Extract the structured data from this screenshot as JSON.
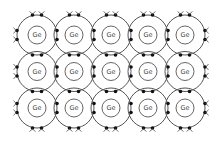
{
  "diagram": {
    "title": "",
    "atom_label": "Ge",
    "rows": 3,
    "cols": 5,
    "atoms": [
      {
        "row": 0,
        "col": 0,
        "label": "Ge"
      },
      {
        "row": 0,
        "col": 1,
        "label": "Ge"
      },
      {
        "row": 0,
        "col": 2,
        "label": "Ge"
      },
      {
        "row": 0,
        "col": 3,
        "label": "Ge"
      },
      {
        "row": 0,
        "col": 4,
        "label": "Ge"
      },
      {
        "row": 1,
        "col": 0,
        "label": "Ge"
      },
      {
        "row": 1,
        "col": 1,
        "label": "Ge"
      },
      {
        "row": 1,
        "col": 2,
        "label": "Ge"
      },
      {
        "row": 1,
        "col": 3,
        "label": "Ge"
      },
      {
        "row": 1,
        "col": 4,
        "label": "Ge"
      },
      {
        "row": 2,
        "col": 0,
        "label": "Ge"
      },
      {
        "row": 2,
        "col": 1,
        "label": "Ge"
      },
      {
        "row": 2,
        "col": 2,
        "label": "Ge"
      },
      {
        "row": 2,
        "col": 3,
        "label": "Ge"
      },
      {
        "row": 2,
        "col": 4,
        "label": "Ge"
      }
    ],
    "layout": {
      "origin_x": 37,
      "origin_y": 35,
      "spacing_x": 37,
      "spacing_y": 36.5,
      "outer_radius": 20,
      "inner_radius": 9,
      "electron_radius": 1.8,
      "electron_offset": 4.5
    },
    "colors": {
      "line": "#555555",
      "electron": "#111111",
      "label": "#444444",
      "background": "#ffffff"
    }
  }
}
